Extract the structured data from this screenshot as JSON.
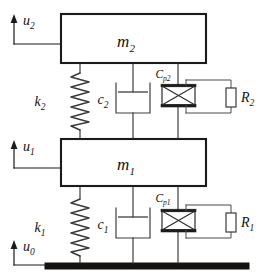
{
  "diagram": {
    "type": "mechanical-schematic",
    "colors": {
      "line": "#2b2b2b",
      "mass_outline": "#1a1a1a",
      "ground": "#15120f",
      "background": "#ffffff"
    },
    "masses": [
      {
        "id": "m2",
        "symbol": "m",
        "subscript": "2",
        "label": "m2"
      },
      {
        "id": "m1",
        "symbol": "m",
        "subscript": "1",
        "label": "m1"
      }
    ],
    "springs": [
      {
        "id": "k2",
        "symbol": "k",
        "subscript": "2",
        "label": "k2"
      },
      {
        "id": "k1",
        "symbol": "k",
        "subscript": "1",
        "label": "k1"
      }
    ],
    "dampers": [
      {
        "id": "c2",
        "symbol": "c",
        "subscript": "2",
        "label": "c2"
      },
      {
        "id": "c1",
        "symbol": "c",
        "subscript": "1",
        "label": "c1"
      }
    ],
    "piezos": [
      {
        "id": "Cp2",
        "symbol": "C",
        "subscript": "p2",
        "label": "Cp2"
      },
      {
        "id": "Cp1",
        "symbol": "C",
        "subscript": "p1",
        "label": "Cp1"
      }
    ],
    "resistors": [
      {
        "id": "R2",
        "symbol": "R",
        "subscript": "2",
        "label": "R2"
      },
      {
        "id": "R1",
        "symbol": "R",
        "subscript": "1",
        "label": "R1"
      }
    ],
    "displacements": [
      {
        "id": "u2",
        "symbol": "u",
        "subscript": "2",
        "label": "u2",
        "direction": "up"
      },
      {
        "id": "u1",
        "symbol": "u",
        "subscript": "1",
        "label": "u1",
        "direction": "up"
      },
      {
        "id": "u0",
        "symbol": "u",
        "subscript": "0",
        "label": "u0",
        "direction": "up"
      }
    ],
    "ground": {
      "id": "base",
      "label": "ground"
    }
  }
}
